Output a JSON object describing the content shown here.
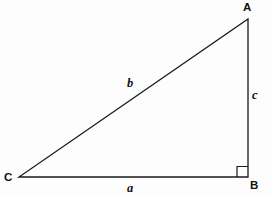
{
  "figure": {
    "type": "right-triangle-diagram",
    "background_color": "#fdfdfd",
    "stroke_color": "#1a1a1a",
    "stroke_width": 1.3,
    "vertices": {
      "A": {
        "label": "A",
        "x": 248,
        "y": 19
      },
      "B": {
        "label": "B",
        "x": 248,
        "y": 177
      },
      "C": {
        "label": "C",
        "x": 19,
        "y": 177
      }
    },
    "sides": {
      "a": {
        "label": "a",
        "from": "C",
        "to": "B",
        "description": "base"
      },
      "b": {
        "label": "b",
        "from": "C",
        "to": "A",
        "description": "hypotenuse"
      },
      "c": {
        "label": "c",
        "from": "A",
        "to": "B",
        "description": "vertical leg"
      }
    },
    "right_angle": {
      "at_vertex": "B",
      "marker": "square",
      "size": 11
    }
  }
}
